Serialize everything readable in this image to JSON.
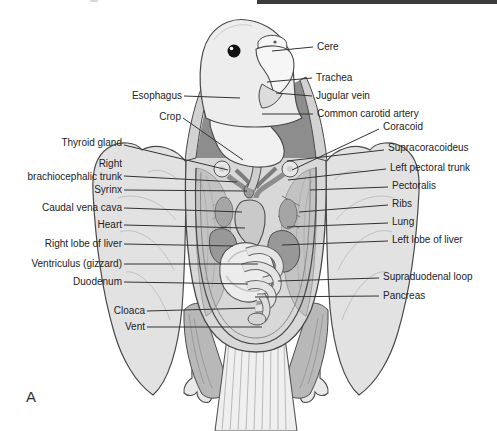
{
  "figure": {
    "panel_label": "A"
  },
  "header_rule": {
    "color": "#3c3c3c"
  },
  "annotation": {
    "line_color": "#333333",
    "text_color": "#222222",
    "labels": [
      {
        "id": "esophagus",
        "text": "Esophagus",
        "x": 182,
        "y": 96,
        "align": "right",
        "line": [
          184,
          96,
          240,
          98
        ]
      },
      {
        "id": "crop",
        "text": "Crop",
        "x": 181,
        "y": 117,
        "align": "right",
        "line": [
          183,
          118,
          243,
          160
        ]
      },
      {
        "id": "thyroid-gland",
        "text": "Thyroid gland",
        "x": 122,
        "y": 143,
        "align": "right",
        "line": [
          124,
          145,
          228,
          170
        ]
      },
      {
        "id": "right-brachiocephalic-trunk",
        "text": "Right\nbrachiocephalic trunk",
        "x": 122,
        "y": 170,
        "align": "right",
        "line": [
          124,
          176,
          237,
          182
        ]
      },
      {
        "id": "syrinx",
        "text": "Syrinx",
        "x": 122,
        "y": 190,
        "align": "right",
        "line": [
          124,
          190,
          247,
          191
        ]
      },
      {
        "id": "caudal-vena-cava",
        "text": "Caudal vena cava",
        "x": 122,
        "y": 208,
        "align": "right",
        "line": [
          124,
          208,
          242,
          212
        ]
      },
      {
        "id": "heart",
        "text": "Heart",
        "x": 122,
        "y": 225,
        "align": "right",
        "line": [
          124,
          225,
          245,
          228
        ]
      },
      {
        "id": "right-lobe-of-liver",
        "text": "Right lobe of liver",
        "x": 122,
        "y": 244,
        "align": "right",
        "line": [
          124,
          244,
          233,
          246
        ]
      },
      {
        "id": "ventriculus-gizzard",
        "text": "Ventriculus (gizzard)",
        "x": 122,
        "y": 264,
        "align": "right",
        "line": [
          124,
          264,
          258,
          264
        ]
      },
      {
        "id": "duodenum",
        "text": "Duodenum",
        "x": 122,
        "y": 282,
        "align": "right",
        "line": [
          124,
          282,
          248,
          284
        ]
      },
      {
        "id": "cloaca",
        "text": "Cloaca",
        "x": 145,
        "y": 311,
        "align": "right",
        "line": [
          147,
          311,
          255,
          308
        ]
      },
      {
        "id": "vent",
        "text": "Vent",
        "x": 145,
        "y": 327,
        "align": "right",
        "line": [
          147,
          327,
          262,
          327
        ]
      },
      {
        "id": "cere",
        "text": "Cere",
        "x": 317,
        "y": 47,
        "align": "left",
        "line": [
          272,
          51,
          313,
          47
        ]
      },
      {
        "id": "trachea",
        "text": "Trachea",
        "x": 316,
        "y": 78,
        "align": "left",
        "line": [
          267,
          82,
          312,
          78
        ]
      },
      {
        "id": "jugular-vein",
        "text": "Jugular vein",
        "x": 316,
        "y": 96,
        "align": "left",
        "line": [
          276,
          93,
          312,
          96
        ]
      },
      {
        "id": "common-carotid-artery",
        "text": "Common carotid artery",
        "x": 317,
        "y": 114,
        "align": "left",
        "line": [
          262,
          114,
          313,
          114
        ]
      },
      {
        "id": "coracoid",
        "text": "Coracoid",
        "x": 383,
        "y": 127,
        "align": "left",
        "line": [
          292,
          170,
          379,
          129
        ]
      },
      {
        "id": "supracoracoideus",
        "text": "Supracoracoideus",
        "x": 388,
        "y": 148,
        "align": "left",
        "line": [
          287,
          161,
          384,
          150
        ]
      },
      {
        "id": "left-pectoral-trunk",
        "text": "Left pectoral trunk",
        "x": 390,
        "y": 168,
        "align": "left",
        "line": [
          288,
          180,
          386,
          169
        ]
      },
      {
        "id": "pectoralis",
        "text": "Pectoralis",
        "x": 392,
        "y": 186,
        "align": "left",
        "line": [
          310,
          190,
          388,
          187
        ]
      },
      {
        "id": "ribs",
        "text": "Ribs",
        "x": 392,
        "y": 204,
        "align": "left",
        "line": [
          299,
          212,
          388,
          205
        ]
      },
      {
        "id": "lung",
        "text": "Lung",
        "x": 392,
        "y": 222,
        "align": "left",
        "line": [
          287,
          227,
          388,
          223
        ]
      },
      {
        "id": "left-lobe-of-liver",
        "text": "Left lobe of liver",
        "x": 392,
        "y": 240,
        "align": "left",
        "line": [
          282,
          245,
          388,
          241
        ]
      },
      {
        "id": "supraduodenal-loop",
        "text": "Supraduodenal loop",
        "x": 383,
        "y": 277,
        "align": "left",
        "line": [
          278,
          281,
          379,
          278
        ]
      },
      {
        "id": "pancreas",
        "text": "Pancreas",
        "x": 383,
        "y": 296,
        "align": "left",
        "line": [
          255,
          297,
          379,
          296
        ]
      }
    ]
  }
}
